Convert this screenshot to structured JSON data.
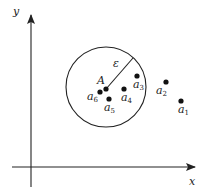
{
  "diagram": {
    "type": "epsilon-neighborhood",
    "axes": {
      "x_label": "x",
      "y_label": "y"
    },
    "circle": {
      "center_point": "A",
      "radius_label": "ε"
    },
    "center": {
      "label": "A"
    },
    "points": [
      {
        "id": "a1",
        "base": "a",
        "sub": "1",
        "inside": false
      },
      {
        "id": "a2",
        "base": "a",
        "sub": "2",
        "inside": false
      },
      {
        "id": "a3",
        "base": "a",
        "sub": "3",
        "inside": true
      },
      {
        "id": "a4",
        "base": "a",
        "sub": "4",
        "inside": true
      },
      {
        "id": "a5",
        "base": "a",
        "sub": "5",
        "inside": true
      },
      {
        "id": "a6",
        "base": "a",
        "sub": "6",
        "inside": true
      }
    ],
    "colors": {
      "stroke": "#222222",
      "background": "#ffffff"
    }
  }
}
